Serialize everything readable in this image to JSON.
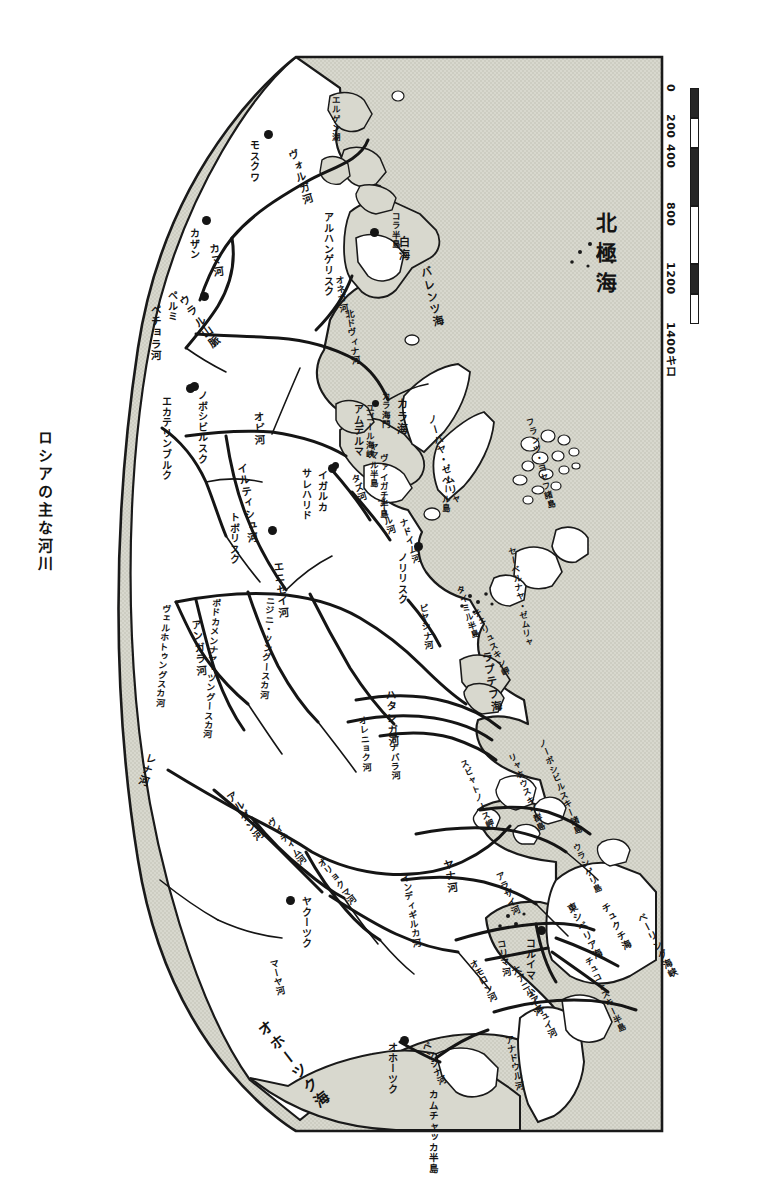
{
  "title": "ロシアの主な河川",
  "colors": {
    "land_fill": "#ffffff",
    "sea_fill": "#d6d6cc",
    "outline": "#1a1a1a",
    "text": "#141414"
  },
  "scale": {
    "unit_label": "1400キロ",
    "ticks": [
      "0",
      "200",
      "400",
      "800",
      "1200",
      "1400キロ"
    ]
  },
  "oceans": [
    {
      "name": "arctic-ocean",
      "label": "北極海"
    },
    {
      "name": "okhotsk-sea",
      "label": "オホーツク海"
    }
  ],
  "seas": [
    {
      "name": "white-sea",
      "label": "白海"
    },
    {
      "name": "barents-sea",
      "label": "バレンツ海"
    },
    {
      "name": "kara-sea",
      "label": "カラ海"
    },
    {
      "name": "laptev-sea",
      "label": "ラプテフ海"
    },
    {
      "name": "east-siberian-sea",
      "label": "東シベリア海"
    },
    {
      "name": "chukchi-sea",
      "label": "チュクチ海"
    },
    {
      "name": "bering-strait",
      "label": "ベーリング海峡"
    },
    {
      "name": "yugor-strait",
      "label": "ユゴール海峡"
    },
    {
      "name": "kara-gate",
      "label": "カラ海門"
    }
  ],
  "islands": [
    {
      "name": "novaya-zemlya",
      "label": "ノーバヤ・ゼムリャ"
    },
    {
      "name": "franz-josef-land",
      "label": "フランツ・ヨセフ諸島"
    },
    {
      "name": "severnaya-zemlya",
      "label": "セーベルナヤ・ゼムリャ"
    },
    {
      "name": "new-siberian-islands",
      "label": "ノーボシビルスキー諸島"
    },
    {
      "name": "lyakhovsky-islands",
      "label": "リャホウスキイ群島"
    },
    {
      "name": "wrangel-island",
      "label": "ウランゲリ島"
    },
    {
      "name": "vaygach-island",
      "label": "ヴァイガチ半島"
    },
    {
      "name": "bely-island",
      "label": "ベール島"
    },
    {
      "name": "kola-peninsula",
      "label": "コラ半島"
    },
    {
      "name": "yamal-peninsula",
      "label": "ヤマル半島"
    },
    {
      "name": "taymyr-peninsula",
      "label": "タイミル半島"
    },
    {
      "name": "cape-chelyuskin",
      "label": "チェリュスキン岬"
    },
    {
      "name": "chukotka-peninsula",
      "label": "チュコトスキー半島"
    },
    {
      "name": "kamchatka-peninsula",
      "label": "カムチャッカ半島"
    },
    {
      "name": "svyatoy-nos",
      "label": "スビャトノース岬"
    },
    {
      "name": "elgygytgyn-lake",
      "label": "エルゲン湖"
    }
  ],
  "rivers": [
    {
      "name": "volga",
      "label": "ヴォルガ河"
    },
    {
      "name": "kama",
      "label": "カマ河"
    },
    {
      "name": "pechora",
      "label": "ペチョラ河"
    },
    {
      "name": "ob",
      "label": "オビ河"
    },
    {
      "name": "irtysh",
      "label": "イルティシュ河"
    },
    {
      "name": "yenisei",
      "label": "エニセイ河"
    },
    {
      "name": "angara",
      "label": "アンガラ河"
    },
    {
      "name": "nizhnyaya-tunguska",
      "label": "ニジニ・ツングースカ河"
    },
    {
      "name": "podkamennaya-tunguska",
      "label": "ポドカメンナヤ・ツングースカ河"
    },
    {
      "name": "verkhnyaya-tunguska",
      "label": "ヴェルホトゥングスカ河"
    },
    {
      "name": "pyasina",
      "label": "ピヤシナ河"
    },
    {
      "name": "khatanga",
      "label": "ハタンガ河"
    },
    {
      "name": "anabar",
      "label": "アナバラ河"
    },
    {
      "name": "olenyok",
      "label": "オレニョク河"
    },
    {
      "name": "lena",
      "label": "レナ河"
    },
    {
      "name": "aldan",
      "label": "アルダン河"
    },
    {
      "name": "vitim",
      "label": "ヴィティム河"
    },
    {
      "name": "olyokma",
      "label": "オリョクマ河"
    },
    {
      "name": "maya",
      "label": "マーヤ河"
    },
    {
      "name": "yana",
      "label": "ヤナ河"
    },
    {
      "name": "indigirka",
      "label": "インディギルカ河"
    },
    {
      "name": "alazeya",
      "label": "アラザイ河"
    },
    {
      "name": "kolyma",
      "label": "コリマ河"
    },
    {
      "name": "omolon",
      "label": "オモロン河"
    },
    {
      "name": "bolshoy-anyuy",
      "label": "大アニュイ河"
    },
    {
      "name": "maly-anyuy",
      "label": "小アニュイ河"
    },
    {
      "name": "anadyr",
      "label": "アナドウル河"
    },
    {
      "name": "penzhina",
      "label": "ペンジナ河"
    },
    {
      "name": "taz",
      "label": "タズ河"
    },
    {
      "name": "pur",
      "label": "プール河"
    },
    {
      "name": "nadym",
      "label": "ナドイム河"
    },
    {
      "name": "onega",
      "label": "オネガ河"
    },
    {
      "name": "sev-dvina",
      "label": "北ドヴィナ河"
    }
  ],
  "cities": [
    {
      "name": "moscow",
      "label": "モスクワ"
    },
    {
      "name": "kazan",
      "label": "カザン"
    },
    {
      "name": "perm",
      "label": "ペルミ"
    },
    {
      "name": "yekaterinburg",
      "label": "エカテリンブルク"
    },
    {
      "name": "tobolsk",
      "label": "トボリスク"
    },
    {
      "name": "novosibirsk",
      "label": "ノボシビルスク"
    },
    {
      "name": "salekhard",
      "label": "サレハリド"
    },
    {
      "name": "arkhangelsk",
      "label": "アルハンゲリスク"
    },
    {
      "name": "norilsk",
      "label": "ノリリスク"
    },
    {
      "name": "yakutsk",
      "label": "ヤクーツク"
    },
    {
      "name": "okhotsk",
      "label": "オホーツク"
    },
    {
      "name": "kolyma-town",
      "label": "コルイマ"
    },
    {
      "name": "amderma",
      "label": "アムデルマ"
    },
    {
      "name": "igarka",
      "label": "イガルカ"
    }
  ],
  "mountains": [
    {
      "name": "ural-mountains",
      "label": "ウラル山脈"
    }
  ],
  "lakes": [
    {
      "name": "elbe-lake",
      "label": "エルゲン湖"
    }
  ]
}
